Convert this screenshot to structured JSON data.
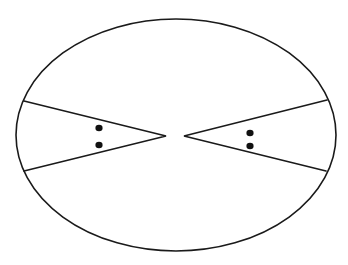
{
  "diagram": {
    "description": "Ellipse containing two opposing wedge shapes, each with two dots",
    "colors": {
      "stroke": "#1a1a1a",
      "dot": "#111111",
      "background": "#ffffff"
    },
    "ellipse": {
      "cx": 176,
      "cy": 135,
      "rx": 160,
      "ry": 116
    },
    "wedges": [
      {
        "name": "left-wedge",
        "top": [
          24,
          101
        ],
        "apex": [
          166,
          136
        ],
        "bottom": [
          24,
          171
        ],
        "dots": [
          [
            99,
            128
          ],
          [
            99,
            145
          ]
        ]
      },
      {
        "name": "right-wedge",
        "top": [
          327,
          100
        ],
        "apex": [
          184,
          136
        ],
        "bottom": [
          326,
          171
        ],
        "dots": [
          [
            250,
            133
          ],
          [
            250,
            146
          ]
        ]
      }
    ]
  }
}
